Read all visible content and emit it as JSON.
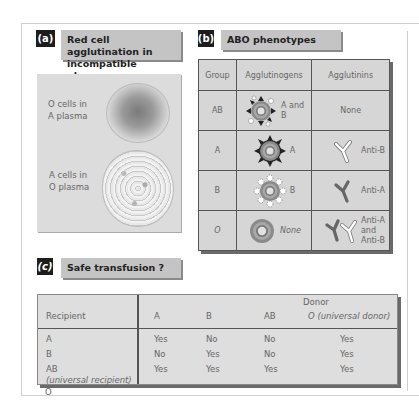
{
  "panel_a": {
    "tag": "(a)",
    "title_line1": "Red cell agglutination in",
    "title_line2": "incompatible plasma",
    "labels": [
      {
        "line1": "O cells in",
        "line2": "A plasma"
      },
      {
        "line1": "A cells in",
        "line2": "O plasma"
      }
    ]
  },
  "panel_b": {
    "tag": "(b)",
    "title": "ABO phenotypes",
    "headers": [
      "Group",
      "Agglutinogens",
      "Agglutinins"
    ],
    "rows": [
      {
        "group": "AB",
        "agglutinogen": "A and B",
        "agglutinogen_l1": "A and",
        "agglutinogen_l2": "B",
        "agglutinin": "None"
      },
      {
        "group": "A",
        "agglutinogen": "A",
        "agglutinin": "Anti-B"
      },
      {
        "group": "B",
        "agglutinogen": "B",
        "agglutinin": "Anti-A"
      },
      {
        "group": "O",
        "agglutinogen": "None",
        "agglutinin_l1": "Anti-A",
        "agglutinin_l2": "and",
        "agglutinin_l3": "Anti-B"
      }
    ]
  },
  "panel_c": {
    "tag": "(c)",
    "title": "Safe transfusion ?",
    "donor_label": "Donor",
    "recipient_label": "Recipient",
    "donor_columns": [
      "A",
      "B",
      "AB",
      "O (universal donor)"
    ],
    "rows": [
      {
        "recipient": "A",
        "values": [
          "Yes",
          "No",
          "No",
          "Yes"
        ]
      },
      {
        "recipient": "B",
        "values": [
          "No",
          "Yes",
          "No",
          "Yes"
        ]
      },
      {
        "recipient": "AB",
        "note": "(universal recipient)",
        "values": [
          "Yes",
          "Yes",
          "Yes",
          "Yes"
        ]
      },
      {
        "recipient": "O",
        "values": [
          "No",
          "No",
          "No",
          "Yes"
        ]
      }
    ]
  },
  "colors": {
    "tag_bg": "#1d1d1d",
    "title_bg": "#c4c4c4",
    "table_bg": "#d6d6d6",
    "panel_bg": "#dcdcdc"
  }
}
